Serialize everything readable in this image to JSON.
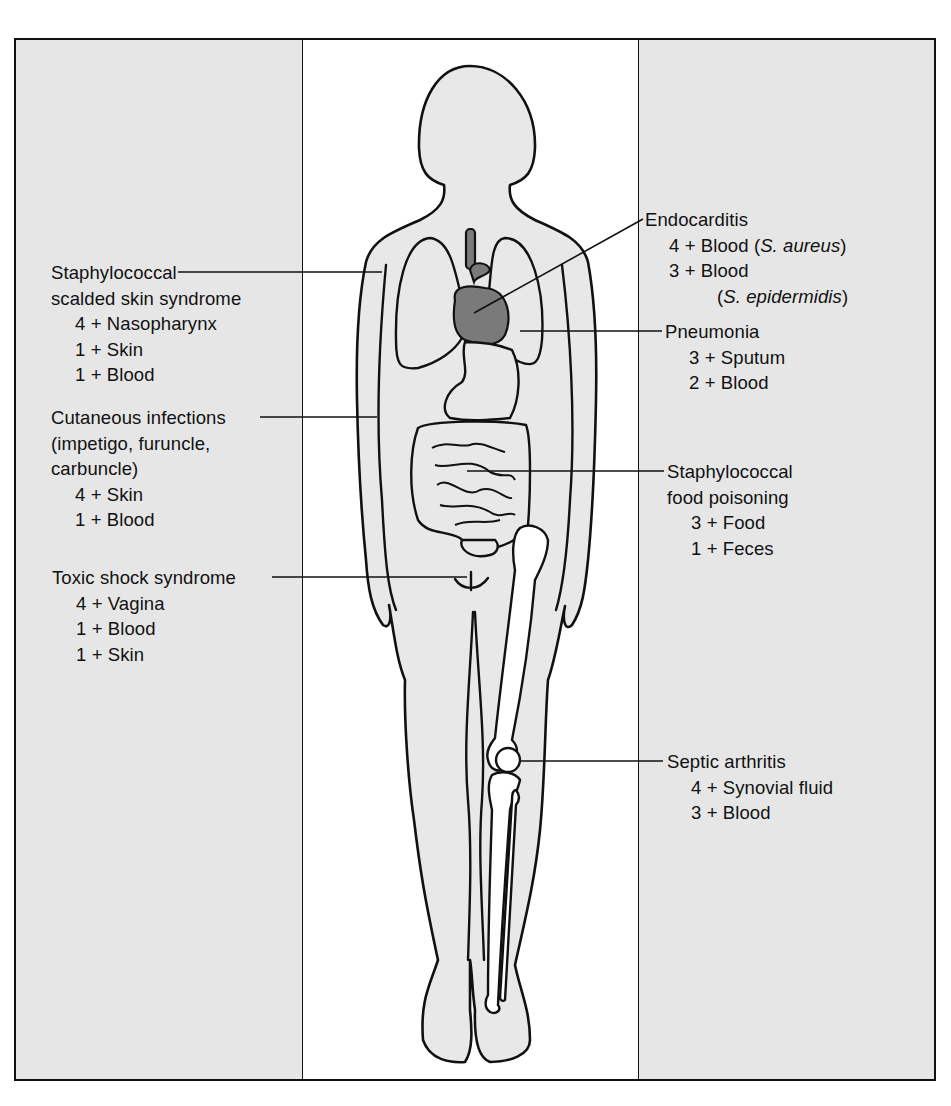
{
  "figure": {
    "colors": {
      "panel_fill": "#e6e6e6",
      "body_fill": "#e8e8e8",
      "heart_fill": "#7a7a7a",
      "outline": "#111111",
      "bone_fill": "#ffffff"
    }
  },
  "left_labels": [
    {
      "title_lines": [
        "Staphylococcal",
        "scalded skin syndrome"
      ],
      "specimens": [
        {
          "grade": "4 +",
          "site": "Nasopharynx"
        },
        {
          "grade": "1 +",
          "site": "Skin"
        },
        {
          "grade": "1 +",
          "site": "Blood"
        }
      ]
    },
    {
      "title_lines": [
        "Cutaneous infections",
        "(impetigo, furuncle,",
        "carbuncle)"
      ],
      "specimens": [
        {
          "grade": "4 +",
          "site": "Skin"
        },
        {
          "grade": "1 +",
          "site": "Blood"
        }
      ]
    },
    {
      "title_lines": [
        "Toxic shock syndrome"
      ],
      "specimens": [
        {
          "grade": "4 +",
          "site": "Vagina"
        },
        {
          "grade": "1 +",
          "site": "Blood"
        },
        {
          "grade": "1 +",
          "site": "Skin"
        }
      ]
    }
  ],
  "right_labels": [
    {
      "title_lines": [
        "Endocarditis"
      ],
      "specimens": [
        {
          "grade": "4 +",
          "site": "Blood",
          "organism": "S. aureus"
        },
        {
          "grade": "3 +",
          "site": "Blood",
          "organism": "S. epidermidis"
        }
      ]
    },
    {
      "title_lines": [
        "Pneumonia"
      ],
      "specimens": [
        {
          "grade": "3 +",
          "site": "Sputum"
        },
        {
          "grade": "2 +",
          "site": "Blood"
        }
      ]
    },
    {
      "title_lines": [
        "Staphylococcal",
        "food poisoning"
      ],
      "specimens": [
        {
          "grade": "3 +",
          "site": "Food"
        },
        {
          "grade": "1 +",
          "site": "Feces"
        }
      ]
    },
    {
      "title_lines": [
        "Septic arthritis"
      ],
      "specimens": [
        {
          "grade": "4 +",
          "site": "Synovial fluid"
        },
        {
          "grade": "3 +",
          "site": "Blood"
        }
      ]
    }
  ],
  "ui": {
    "paren_open": "(",
    "paren_close": ")",
    "space": " "
  }
}
